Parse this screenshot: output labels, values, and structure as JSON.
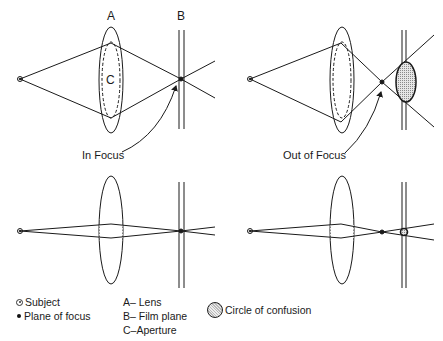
{
  "diagram": {
    "title_hidden": "",
    "panels": [
      {
        "id": "top-left",
        "caption": "In Focus",
        "state": "in-focus",
        "aperture": "wide"
      },
      {
        "id": "top-right",
        "caption": "Out of Focus",
        "state": "out-of-focus",
        "aperture": "wide"
      },
      {
        "id": "bottom-left",
        "caption": "",
        "state": "in-focus",
        "aperture": "narrow"
      },
      {
        "id": "bottom-right",
        "caption": "",
        "state": "out-of-focus",
        "aperture": "narrow"
      }
    ],
    "labels": {
      "lens_letter": "A",
      "film_letter": "B",
      "aperture_letter": "C",
      "in_focus": "In Focus",
      "out_of_focus": "Out of Focus"
    },
    "colors": {
      "line": "#1a1a1a",
      "background": "#ffffff",
      "coc_fill": "#c8c8c8"
    }
  },
  "legend": {
    "symbols": [
      {
        "icon": "subject-icon",
        "label": "Subject"
      },
      {
        "icon": "plane-of-focus-dot-icon",
        "label": "Plane of focus"
      }
    ],
    "letters": [
      {
        "key": "A",
        "label": "A– Lens"
      },
      {
        "key": "B",
        "label": "B– Film plane"
      },
      {
        "key": "C",
        "label": "C–Aperture"
      }
    ],
    "circle_of_confusion": {
      "icon": "circle-of-confusion-icon",
      "label": "Circle of confusion"
    }
  }
}
